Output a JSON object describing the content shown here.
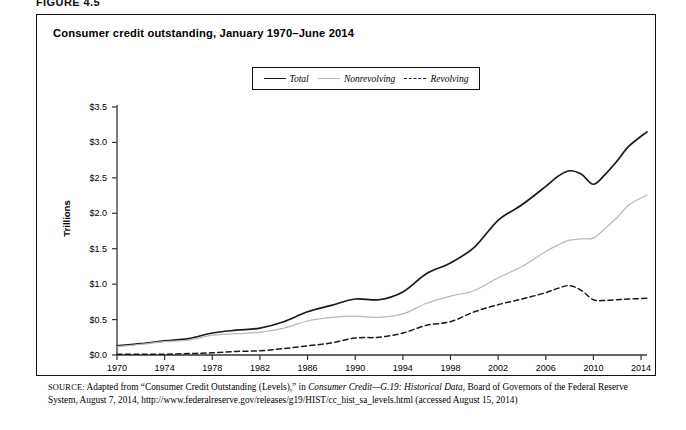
{
  "figure": {
    "label": "FIGURE 4.5",
    "title": "Consumer credit outstanding, January 1970–June 2014"
  },
  "axes": {
    "ylabel": "Trillions",
    "yticks": [
      "$0.0",
      "$0.5",
      "$1.0",
      "$1.5",
      "$2.0",
      "$2.5",
      "$3.0",
      "$3.5"
    ],
    "xticks": [
      "1970",
      "1974",
      "1978",
      "1982",
      "1986",
      "1990",
      "1994",
      "1998",
      "2002",
      "2006",
      "2010",
      "2014"
    ]
  },
  "legend": [
    {
      "label": "Total",
      "style": "solid",
      "color": "#1a1a1a"
    },
    {
      "label": "Nonrevolving",
      "style": "light-solid",
      "color": "#b9b9b9"
    },
    {
      "label": "Revolving",
      "style": "dashed",
      "color": "#1a1a1a"
    }
  ],
  "source": {
    "prefix": "SOURCE:",
    "text_1": " Adapted from “Consumer Credit Outstanding (Levels),” in ",
    "italic_1": "Consumer Credit—G.19: Historical Data",
    "text_2": ", Board of Governors of the Federal Reserve System, August 7, 2014, http://www.federalreserve.gov/releases/g19/HIST/cc_hist_sa_levels.html (accessed August 15, 2014)"
  },
  "chart_data": {
    "type": "line",
    "title": "Consumer credit outstanding, January 1970–June 2014",
    "xlabel": "",
    "ylabel": "Trillions",
    "xlim": [
      1970,
      2014.5
    ],
    "ylim": [
      0.0,
      3.5
    ],
    "grid": false,
    "legend_position": "top-center",
    "units": "trillions of US dollars",
    "x": [
      1970,
      1972,
      1974,
      1976,
      1978,
      1980,
      1982,
      1984,
      1986,
      1988,
      1990,
      1992,
      1994,
      1996,
      1998,
      2000,
      2002,
      2004,
      2006,
      2007,
      2008,
      2009,
      2010,
      2011,
      2012,
      2013,
      2014.5
    ],
    "series": [
      {
        "name": "Total",
        "style": "solid",
        "color": "#1a1a1a",
        "values": [
          0.13,
          0.16,
          0.2,
          0.23,
          0.31,
          0.35,
          0.38,
          0.47,
          0.61,
          0.7,
          0.79,
          0.78,
          0.89,
          1.15,
          1.3,
          1.52,
          1.9,
          2.12,
          2.38,
          2.52,
          2.6,
          2.55,
          2.41,
          2.55,
          2.74,
          2.95,
          3.15
        ]
      },
      {
        "name": "Nonrevolving",
        "style": "light-solid",
        "color": "#b9b9b9",
        "values": [
          0.12,
          0.15,
          0.19,
          0.21,
          0.28,
          0.3,
          0.32,
          0.38,
          0.48,
          0.53,
          0.55,
          0.53,
          0.58,
          0.73,
          0.83,
          0.91,
          1.09,
          1.25,
          1.46,
          1.55,
          1.62,
          1.64,
          1.65,
          1.79,
          1.94,
          2.12,
          2.26
        ]
      },
      {
        "name": "Revolving",
        "style": "dashed",
        "color": "#1a1a1a",
        "values": [
          0.01,
          0.01,
          0.01,
          0.02,
          0.03,
          0.05,
          0.06,
          0.09,
          0.13,
          0.17,
          0.24,
          0.25,
          0.31,
          0.42,
          0.47,
          0.61,
          0.71,
          0.79,
          0.88,
          0.94,
          0.98,
          0.91,
          0.78,
          0.77,
          0.78,
          0.79,
          0.8
        ]
      }
    ]
  }
}
